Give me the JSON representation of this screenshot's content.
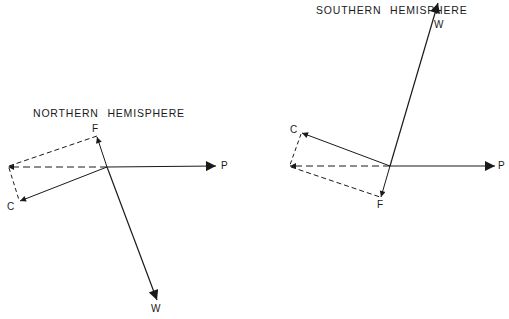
{
  "northern": {
    "title": "NORTHERN HEMISPHERE",
    "labels": {
      "F": "F",
      "C": "C",
      "P": "P",
      "W": "W"
    }
  },
  "southern": {
    "title": "SOUTHERN HEMISPHERE",
    "labels": {
      "F": "F",
      "C": "C",
      "P": "P",
      "W": "W"
    }
  },
  "colors": {
    "stroke": "#1a1a1a",
    "background": "#ffffff"
  }
}
